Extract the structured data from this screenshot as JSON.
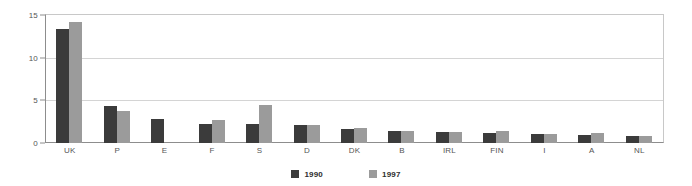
{
  "chart_data": {
    "type": "bar",
    "title": "",
    "subtitle": "",
    "xlabel": "",
    "ylabel": "",
    "ylim": [
      0,
      15
    ],
    "yticks": [
      0,
      5,
      10,
      15
    ],
    "ytick_labels": [
      "0",
      "5",
      "10",
      "15"
    ],
    "grid": true,
    "legend_position": "bottom-center",
    "categories": [
      "UK",
      "P",
      "E",
      "F",
      "S",
      "D",
      "DK",
      "B",
      "IRL",
      "FIN",
      "I",
      "A",
      "NL"
    ],
    "series": [
      {
        "name": "1990",
        "color": "#3b3b3b",
        "values": [
          13.4,
          4.3,
          2.8,
          2.2,
          2.2,
          2.1,
          1.6,
          1.4,
          1.3,
          1.2,
          1.0,
          0.9,
          0.8
        ]
      },
      {
        "name": "1997",
        "color": "#9b9b9b",
        "values": [
          14.2,
          3.8,
          0.0,
          2.7,
          4.4,
          2.1,
          1.8,
          1.4,
          1.3,
          1.4,
          1.0,
          1.2,
          0.8
        ]
      }
    ]
  },
  "legend": {
    "items": [
      {
        "label": "1990",
        "color": "#3b3b3b"
      },
      {
        "label": "1997",
        "color": "#9b9b9b"
      }
    ]
  },
  "colors": {
    "series_1990": "#3b3b3b",
    "series_1997": "#9b9b9b",
    "grid": "#d4d4d4",
    "axis": "#8d8d8d",
    "frame": "#c8c8c8",
    "tick_text": "#555555",
    "background": "#ffffff"
  }
}
